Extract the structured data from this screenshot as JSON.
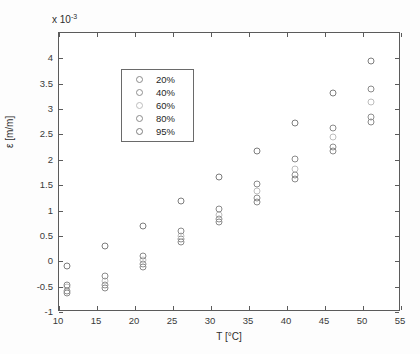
{
  "chart_data": {
    "type": "scatter",
    "title": "",
    "xlabel": "T [°C]",
    "ylabel": "ε [m/m]",
    "y_exponent_label": "x 10",
    "y_exponent_value": "-3",
    "xlim": [
      10,
      55
    ],
    "ylim": [
      -1,
      4.5
    ],
    "xticks": [
      10,
      15,
      20,
      25,
      30,
      35,
      40,
      45,
      50,
      55
    ],
    "yticks": [
      -1,
      -0.5,
      0,
      0.5,
      1,
      1.5,
      2,
      2.5,
      3,
      3.5,
      4
    ],
    "xticklabels": [
      "10",
      "15",
      "20",
      "25",
      "30",
      "35",
      "40",
      "45",
      "50",
      "55"
    ],
    "yticklabels": [
      "-1",
      "-0.5",
      "0",
      "0.5",
      "1",
      "1.5",
      "2",
      "2.5",
      "3",
      "3.5",
      "4"
    ],
    "grid": false,
    "legend_position": "upper left",
    "marker": "open-circle",
    "x": [
      11,
      16,
      21,
      26,
      31,
      36,
      41,
      46,
      51
    ],
    "series": [
      {
        "name": "20%",
        "color": "#8a8a8a",
        "values": [
          -0.62,
          -0.52,
          -0.12,
          0.38,
          0.78,
          1.16,
          1.62,
          2.18,
          2.74
        ]
      },
      {
        "name": "40%",
        "color": "#8f8f8f",
        "values": [
          -0.58,
          -0.46,
          -0.06,
          0.44,
          0.84,
          1.24,
          1.7,
          2.26,
          2.84
        ]
      },
      {
        "name": "60%",
        "color": "#bdbdbd",
        "values": [
          -0.5,
          -0.38,
          0.02,
          0.5,
          0.92,
          1.38,
          1.82,
          2.44,
          3.14
        ]
      },
      {
        "name": "80%",
        "color": "#8a8a8a",
        "values": [
          -0.46,
          -0.3,
          0.1,
          0.6,
          1.04,
          1.52,
          2.02,
          2.62,
          3.4
        ]
      },
      {
        "name": "95%",
        "color": "#7d7d7d",
        "values": [
          -0.1,
          0.3,
          0.7,
          1.18,
          1.66,
          2.18,
          2.72,
          3.32,
          3.95
        ]
      }
    ]
  }
}
